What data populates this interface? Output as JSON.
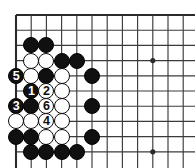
{
  "figure": {
    "kind": "go-board-diagram",
    "title": "",
    "background_color": "#ffffff",
    "line_color": "#3b3b3b",
    "border_color": "#2b2b2b",
    "black_stone_color": "#101010",
    "white_stone_color": "#ffffff",
    "stone_outline_color": "#0d0d0d",
    "black_label_color": "#ffffff",
    "white_label_color": "#101010"
  },
  "board": {
    "origin_x": 16,
    "origin_y": 15,
    "spacing": 15.2,
    "columns": 12,
    "rows": 10,
    "stone_diameter": 16,
    "star_point_radius": 2.6,
    "star_points": [
      {
        "col": 10,
        "row": 4
      },
      {
        "col": 10,
        "row": 10
      }
    ],
    "edges": {
      "top": true,
      "left": true,
      "right": false,
      "bottom": false
    }
  },
  "stones": [
    {
      "id": "b-c2r3",
      "color": "black",
      "col": 2,
      "row": 3,
      "label": ""
    },
    {
      "id": "b-c3r3",
      "color": "black",
      "col": 3,
      "row": 3,
      "label": ""
    },
    {
      "id": "w-c2r4",
      "color": "white",
      "col": 2,
      "row": 4,
      "label": ""
    },
    {
      "id": "w-c3r4",
      "color": "white",
      "col": 3,
      "row": 4,
      "label": ""
    },
    {
      "id": "b-c4r4",
      "color": "black",
      "col": 4,
      "row": 4,
      "label": ""
    },
    {
      "id": "b-c5r4",
      "color": "black",
      "col": 5,
      "row": 4,
      "label": ""
    },
    {
      "id": "b-c1r5",
      "color": "black",
      "col": 1,
      "row": 5,
      "label": "5"
    },
    {
      "id": "w-c2r5",
      "color": "white",
      "col": 2,
      "row": 5,
      "label": ""
    },
    {
      "id": "b-c3r5",
      "color": "black",
      "col": 3,
      "row": 5,
      "label": ""
    },
    {
      "id": "w-c4r5",
      "color": "white",
      "col": 4,
      "row": 5,
      "label": ""
    },
    {
      "id": "b-c6r5",
      "color": "black",
      "col": 6,
      "row": 5,
      "label": ""
    },
    {
      "id": "b-c2r6",
      "color": "black",
      "col": 2,
      "row": 6,
      "label": "1"
    },
    {
      "id": "w-c3r6",
      "color": "white",
      "col": 3,
      "row": 6,
      "label": "2"
    },
    {
      "id": "w-c4r6",
      "color": "white",
      "col": 4,
      "row": 6,
      "label": ""
    },
    {
      "id": "b-c1r7",
      "color": "black",
      "col": 1,
      "row": 7,
      "label": "3"
    },
    {
      "id": "b-c2r7",
      "color": "black",
      "col": 2,
      "row": 7,
      "label": ""
    },
    {
      "id": "w-c3r7",
      "color": "white",
      "col": 3,
      "row": 7,
      "label": "6"
    },
    {
      "id": "w-c4r7",
      "color": "white",
      "col": 4,
      "row": 7,
      "label": ""
    },
    {
      "id": "b-c6r7",
      "color": "black",
      "col": 6,
      "row": 7,
      "label": ""
    },
    {
      "id": "w-c1r8",
      "color": "white",
      "col": 1,
      "row": 8,
      "label": ""
    },
    {
      "id": "w-c2r8",
      "color": "white",
      "col": 2,
      "row": 8,
      "label": ""
    },
    {
      "id": "w-c3r8",
      "color": "white",
      "col": 3,
      "row": 8,
      "label": "4"
    },
    {
      "id": "w-c4r8",
      "color": "white",
      "col": 4,
      "row": 8,
      "label": ""
    },
    {
      "id": "b-c1r9",
      "color": "black",
      "col": 1,
      "row": 9,
      "label": ""
    },
    {
      "id": "b-c2r9",
      "color": "black",
      "col": 2,
      "row": 9,
      "label": ""
    },
    {
      "id": "w-c3r9",
      "color": "white",
      "col": 3,
      "row": 9,
      "label": ""
    },
    {
      "id": "w-c4r9",
      "color": "white",
      "col": 4,
      "row": 9,
      "label": ""
    },
    {
      "id": "b-c6r9",
      "color": "black",
      "col": 6,
      "row": 9,
      "label": ""
    },
    {
      "id": "b-c2r10",
      "color": "black",
      "col": 2,
      "row": 10,
      "label": ""
    },
    {
      "id": "b-c3r10",
      "color": "black",
      "col": 3,
      "row": 10,
      "label": ""
    },
    {
      "id": "b-c4r10",
      "color": "black",
      "col": 4,
      "row": 10,
      "label": ""
    },
    {
      "id": "b-c5r10",
      "color": "black",
      "col": 5,
      "row": 10,
      "label": ""
    }
  ],
  "move_sequence": [
    {
      "number": "1",
      "color": "black"
    },
    {
      "number": "2",
      "color": "white"
    },
    {
      "number": "3",
      "color": "black"
    },
    {
      "number": "4",
      "color": "white"
    },
    {
      "number": "5",
      "color": "black"
    },
    {
      "number": "6",
      "color": "white"
    }
  ]
}
